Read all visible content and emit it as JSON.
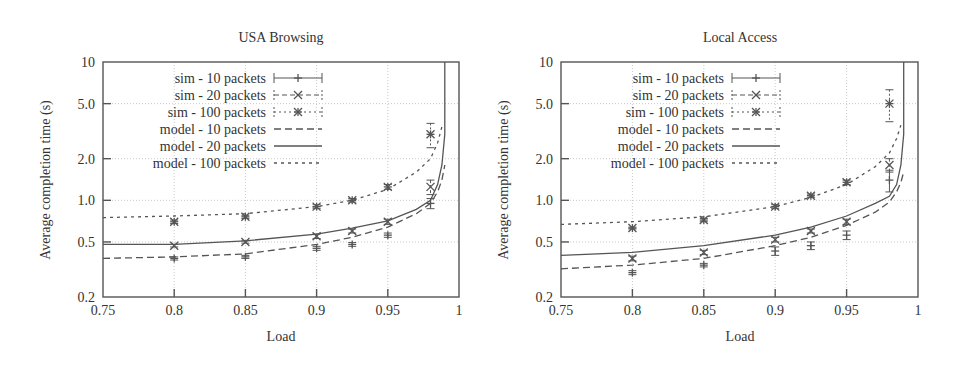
{
  "chart_data": [
    {
      "type": "line",
      "title": "USA Browsing",
      "xlabel": "Load",
      "ylabel": "Average completion time (s)",
      "xlim": [
        0.75,
        1.0
      ],
      "ylim": [
        0.2,
        10
      ],
      "yscale": "log",
      "grid": true,
      "legend_position": "top-left",
      "x_ticks": [
        "0.75",
        "0.8",
        "0.85",
        "0.9",
        "0.95",
        "1"
      ],
      "x_tick_values": [
        0.75,
        0.8,
        0.85,
        0.9,
        0.95,
        1.0
      ],
      "y_ticks": [
        "0.2",
        "0.5",
        "1.0",
        "2.0",
        "5.0",
        "10"
      ],
      "y_tick_values": [
        0.2,
        0.5,
        1.0,
        2.0,
        5.0,
        10
      ],
      "series": [
        {
          "name": "sim - 10 packets",
          "kind": "sim",
          "marker": "plus",
          "x": [
            0.8,
            0.85,
            0.9,
            0.925,
            0.95,
            0.98
          ],
          "y": [
            0.38,
            0.39,
            0.45,
            0.48,
            0.56,
            0.95
          ],
          "err": [
            0.01,
            0.01,
            0.015,
            0.015,
            0.02,
            0.08
          ]
        },
        {
          "name": "sim - 20 packets",
          "kind": "sim",
          "marker": "x",
          "x": [
            0.8,
            0.85,
            0.9,
            0.925,
            0.95,
            0.98
          ],
          "y": [
            0.47,
            0.5,
            0.55,
            0.6,
            0.7,
            1.25
          ],
          "err": [
            0.01,
            0.01,
            0.02,
            0.02,
            0.03,
            0.15
          ]
        },
        {
          "name": "sim - 100 packets",
          "kind": "sim",
          "marker": "star",
          "x": [
            0.8,
            0.85,
            0.9,
            0.925,
            0.95,
            0.98
          ],
          "y": [
            0.7,
            0.76,
            0.9,
            1.0,
            1.25,
            3.0
          ],
          "err": [
            0.02,
            0.02,
            0.03,
            0.03,
            0.05,
            0.6
          ]
        },
        {
          "name": "model - 10 packets",
          "kind": "model",
          "x": [
            0.75,
            0.8,
            0.85,
            0.9,
            0.925,
            0.95,
            0.97,
            0.98,
            0.985,
            0.988,
            0.99
          ],
          "y": [
            0.38,
            0.39,
            0.41,
            0.48,
            0.54,
            0.64,
            0.8,
            0.95,
            1.15,
            1.4,
            1.8
          ]
        },
        {
          "name": "model - 20 packets",
          "kind": "model",
          "x": [
            0.75,
            0.8,
            0.85,
            0.9,
            0.925,
            0.95,
            0.97,
            0.98,
            0.985,
            0.988,
            0.99,
            0.99
          ],
          "y": [
            0.48,
            0.48,
            0.51,
            0.57,
            0.63,
            0.71,
            0.86,
            1.0,
            1.3,
            1.8,
            3.0,
            10
          ]
        },
        {
          "name": "model - 100 packets",
          "kind": "model",
          "x": [
            0.75,
            0.8,
            0.85,
            0.9,
            0.925,
            0.95,
            0.97,
            0.98,
            0.985,
            0.988
          ],
          "y": [
            0.75,
            0.77,
            0.8,
            0.9,
            1.0,
            1.2,
            1.6,
            2.0,
            2.6,
            3.4
          ]
        }
      ]
    },
    {
      "type": "line",
      "title": "Local Access",
      "xlabel": "Load",
      "ylabel": "Average completion time (s)",
      "xlim": [
        0.75,
        1.0
      ],
      "ylim": [
        0.2,
        10
      ],
      "yscale": "log",
      "grid": true,
      "legend_position": "top-left",
      "x_ticks": [
        "0.75",
        "0.8",
        "0.85",
        "0.9",
        "0.95",
        "1"
      ],
      "x_tick_values": [
        0.75,
        0.8,
        0.85,
        0.9,
        0.95,
        1.0
      ],
      "y_ticks": [
        "0.2",
        "0.5",
        "1.0",
        "2.0",
        "5.0",
        "10"
      ],
      "y_tick_values": [
        0.2,
        0.5,
        1.0,
        2.0,
        5.0,
        10
      ],
      "series": [
        {
          "name": "sim - 10 packets",
          "kind": "sim",
          "marker": "plus",
          "x": [
            0.8,
            0.85,
            0.9,
            0.925,
            0.95,
            0.98
          ],
          "y": [
            0.3,
            0.34,
            0.43,
            0.47,
            0.56,
            1.4
          ],
          "err": [
            0.01,
            0.01,
            0.03,
            0.03,
            0.04,
            0.25
          ]
        },
        {
          "name": "sim - 20 packets",
          "kind": "sim",
          "marker": "x",
          "x": [
            0.8,
            0.85,
            0.9,
            0.925,
            0.95,
            0.98
          ],
          "y": [
            0.38,
            0.42,
            0.52,
            0.6,
            0.7,
            1.8
          ],
          "err": [
            0.015,
            0.015,
            0.02,
            0.02,
            0.03,
            0.2
          ]
        },
        {
          "name": "sim - 100 packets",
          "kind": "sim",
          "marker": "star",
          "x": [
            0.8,
            0.85,
            0.9,
            0.925,
            0.95,
            0.98
          ],
          "y": [
            0.63,
            0.72,
            0.9,
            1.08,
            1.35,
            5.0
          ],
          "err": [
            0.01,
            0.02,
            0.03,
            0.03,
            0.05,
            1.3
          ]
        },
        {
          "name": "model - 10 packets",
          "kind": "model",
          "x": [
            0.75,
            0.8,
            0.85,
            0.9,
            0.925,
            0.95,
            0.97,
            0.98,
            0.985,
            0.988,
            0.99
          ],
          "y": [
            0.32,
            0.34,
            0.38,
            0.47,
            0.54,
            0.66,
            0.82,
            0.97,
            1.15,
            1.35,
            1.6
          ]
        },
        {
          "name": "model - 20 packets",
          "kind": "model",
          "x": [
            0.75,
            0.8,
            0.85,
            0.9,
            0.925,
            0.95,
            0.97,
            0.98,
            0.985,
            0.988,
            0.99,
            0.99
          ],
          "y": [
            0.4,
            0.42,
            0.47,
            0.56,
            0.64,
            0.77,
            0.95,
            1.07,
            1.3,
            1.8,
            3.0,
            10
          ]
        },
        {
          "name": "model - 100 packets",
          "kind": "model",
          "x": [
            0.75,
            0.8,
            0.85,
            0.9,
            0.925,
            0.95,
            0.97,
            0.98,
            0.985,
            0.988
          ],
          "y": [
            0.67,
            0.7,
            0.76,
            0.9,
            1.05,
            1.3,
            1.75,
            2.2,
            2.8,
            3.5
          ]
        }
      ]
    }
  ]
}
